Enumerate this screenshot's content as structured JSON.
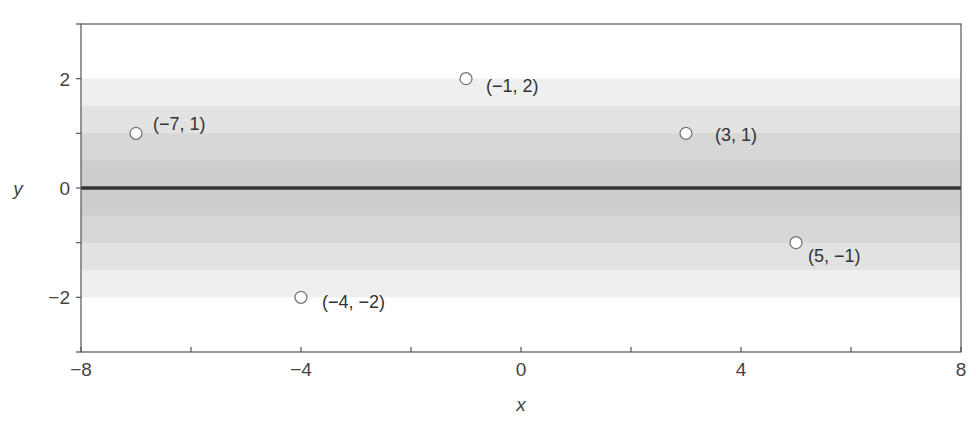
{
  "chart_data": {
    "type": "scatter",
    "title": "",
    "xlabel": "x",
    "ylabel": "y",
    "xlim": [
      -8,
      8
    ],
    "ylim": [
      -3,
      3
    ],
    "x_ticks": [
      -8,
      -6,
      -4,
      -2,
      0,
      2,
      4,
      6,
      8
    ],
    "x_tick_labels": [
      {
        "value": -8,
        "label": "−8"
      },
      {
        "value": -4,
        "label": "−4"
      },
      {
        "value": 0,
        "label": "0"
      },
      {
        "value": 4,
        "label": "4"
      },
      {
        "value": 8,
        "label": "8"
      }
    ],
    "y_ticks": [
      -3,
      -2,
      -1,
      0,
      1,
      2,
      3
    ],
    "y_tick_labels": [
      {
        "value": 2,
        "label": "2"
      },
      {
        "value": 0,
        "label": "0"
      },
      {
        "value": -2,
        "label": "−2"
      }
    ],
    "grid": false,
    "legend": null,
    "points": [
      {
        "x": -7,
        "y": 1,
        "label": "(−7, 1)"
      },
      {
        "x": -4,
        "y": -2,
        "label": "(−4, −2)"
      },
      {
        "x": -1,
        "y": 2,
        "label": "(−1, 2)"
      },
      {
        "x": 3,
        "y": 1,
        "label": "(3, 1)"
      },
      {
        "x": 5,
        "y": -1,
        "label": "(5, −1)"
      }
    ],
    "fit_line": {
      "description": "horizontal regression line",
      "x": [
        -8,
        8
      ],
      "y": [
        0,
        0
      ]
    },
    "bands": {
      "description": "shaded horizontal bands around the fit line, darker toward center",
      "edges_abs": [
        2,
        1.5,
        1,
        0.5
      ],
      "colors": [
        "#efefef",
        "#e2e2e2",
        "#d7d7d7",
        "#cdcdcd"
      ]
    },
    "colors": {
      "fit_line": "#333333",
      "point_fill": "#ffffff",
      "point_stroke": "#777777",
      "axis": "#555555",
      "text": "#444444"
    }
  }
}
